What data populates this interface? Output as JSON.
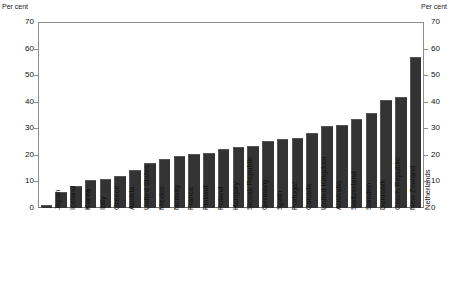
{
  "axis": {
    "unit_label_left": "Per cent",
    "unit_label_right": "Per cent",
    "ticks": [
      "0",
      "10",
      "20",
      "30",
      "40",
      "50",
      "60",
      "70"
    ]
  },
  "chart_data": {
    "type": "bar",
    "title": "",
    "subtitle": "",
    "xlabel": "",
    "ylabel": "Per cent",
    "ylim": [
      0,
      70
    ],
    "ytick_values": [
      0,
      10,
      20,
      30,
      40,
      50,
      60,
      70
    ],
    "grid": false,
    "legend": null,
    "orientation": "vertical",
    "bar_color": "#333333",
    "highlight_category": "Korea",
    "categories": [
      "Japan",
      "Iceland",
      "Korea",
      "Italy",
      "Greece",
      "Austria",
      "United States",
      "Mexico",
      "Norway",
      "France",
      "Finland",
      "Poland",
      "Hungary",
      "Slovak Republic",
      "Germany",
      "Spain",
      "Portugal",
      "Canada",
      "United Kingdom",
      "Australia",
      "Switzerland",
      "Sweden",
      "Denmark",
      "Czech Republic",
      "New Zealand",
      "Netherlands"
    ],
    "values": [
      1,
      6,
      8.5,
      10.5,
      11,
      12,
      14.5,
      17,
      18.5,
      19.5,
      20.5,
      21,
      22.5,
      23,
      23.5,
      25.5,
      26,
      26.5,
      28.5,
      31,
      31.5,
      33.5,
      36,
      41,
      42,
      57
    ],
    "values_note": "",
    "series": [
      {
        "name": "Share",
        "values": [
          1,
          6,
          8.5,
          10.5,
          11,
          12,
          14.5,
          17,
          18.5,
          19.5,
          20.5,
          21,
          22.5,
          23,
          23.5,
          25.5,
          26,
          26.5,
          28.5,
          31,
          31.5,
          33.5,
          36,
          41,
          42,
          57
        ]
      }
    ]
  }
}
